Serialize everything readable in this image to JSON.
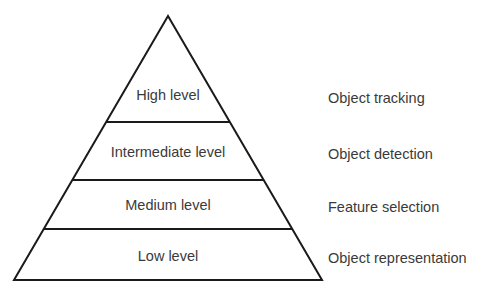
{
  "diagram": {
    "type": "pyramid",
    "levels": [
      {
        "label": "High level",
        "description": "Object tracking"
      },
      {
        "label": "Intermediate level",
        "description": "Object detection"
      },
      {
        "label": "Medium level",
        "description": "Feature selection"
      },
      {
        "label": "Low level",
        "description": "Object representation"
      }
    ],
    "colors": {
      "stroke": "#1a1a1a",
      "fill": "#ffffff",
      "text": "#3a3a3a"
    }
  }
}
